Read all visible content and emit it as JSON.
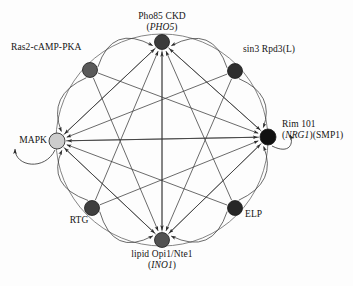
{
  "figure": {
    "type": "network-diagram",
    "background_color": "#fdfdfd",
    "ring": {
      "cx": 162,
      "cy": 140,
      "r": 106,
      "stroke": "#6f6f6f"
    },
    "nodes": [
      {
        "id": "pho85",
        "name_line1": "Pho85 CKD",
        "name_line2_open": "(",
        "name_line2_gene": "PHO5",
        "name_line2_close": ")",
        "x": 162,
        "y": 42,
        "r": 7.5,
        "fill": "#3b3b3b",
        "label_pos": "top"
      },
      {
        "id": "ras2",
        "name_line1": "Ras2-cAMP-PKA",
        "name_line2_open": "",
        "name_line2_gene": "",
        "name_line2_close": "",
        "x": 90,
        "y": 70,
        "r": 7.5,
        "fill": "#5a5a5a",
        "label_pos": "top-left"
      },
      {
        "id": "sin3",
        "name_line1": "sin3 Rpd3(L)",
        "name_line2_open": "",
        "name_line2_gene": "",
        "name_line2_close": "",
        "x": 235,
        "y": 71,
        "r": 7.5,
        "fill": "#2e2e2e",
        "label_pos": "top-right"
      },
      {
        "id": "mapk",
        "name_line1": "MAPK",
        "name_line2_open": "",
        "name_line2_gene": "",
        "name_line2_close": "",
        "x": 57,
        "y": 141,
        "r": 8,
        "fill": "#cccccc",
        "label_pos": "left"
      },
      {
        "id": "rim101",
        "name_line1": "Rim 101",
        "name_line2_open": "(",
        "name_line2_gene": "NRG1",
        "name_line2_close": ")(SMP1)",
        "x": 268,
        "y": 137,
        "r": 8,
        "fill": "#111111",
        "label_pos": "right"
      },
      {
        "id": "rtg",
        "name_line1": "RTG",
        "name_line2_open": "",
        "name_line2_gene": "",
        "name_line2_close": "",
        "x": 92,
        "y": 208,
        "r": 7.5,
        "fill": "#3f3f3f",
        "label_pos": "bottom-left"
      },
      {
        "id": "elp",
        "name_line1": "ELP",
        "name_line2_open": "",
        "name_line2_gene": "",
        "name_line2_close": "",
        "x": 235,
        "y": 208,
        "r": 7.5,
        "fill": "#262626",
        "label_pos": "bottom-right"
      },
      {
        "id": "lipid",
        "name_line1": "lipid Opi1/Nte1",
        "name_line2_open": "(",
        "name_line2_gene": "INO1",
        "name_line2_close": ")",
        "x": 162,
        "y": 240,
        "r": 7.5,
        "fill": "#525252",
        "label_pos": "bottom"
      }
    ],
    "edges": [
      {
        "from": "ras2",
        "to": "pho85"
      },
      {
        "from": "sin3",
        "to": "pho85"
      },
      {
        "from": "mapk",
        "to": "pho85"
      },
      {
        "from": "rim101",
        "to": "pho85"
      },
      {
        "from": "rtg",
        "to": "pho85"
      },
      {
        "from": "elp",
        "to": "pho85"
      },
      {
        "from": "lipid",
        "to": "pho85"
      },
      {
        "from": "pho85",
        "to": "mapk"
      },
      {
        "from": "ras2",
        "to": "mapk"
      },
      {
        "from": "sin3",
        "to": "mapk"
      },
      {
        "from": "rim101",
        "to": "mapk"
      },
      {
        "from": "rtg",
        "to": "mapk"
      },
      {
        "from": "elp",
        "to": "mapk"
      },
      {
        "from": "lipid",
        "to": "mapk"
      },
      {
        "from": "pho85",
        "to": "rim101"
      },
      {
        "from": "ras2",
        "to": "rim101"
      },
      {
        "from": "sin3",
        "to": "rim101"
      },
      {
        "from": "mapk",
        "to": "rim101"
      },
      {
        "from": "rtg",
        "to": "rim101"
      },
      {
        "from": "elp",
        "to": "rim101"
      },
      {
        "from": "lipid",
        "to": "rim101"
      },
      {
        "from": "pho85",
        "to": "lipid"
      },
      {
        "from": "ras2",
        "to": "lipid"
      },
      {
        "from": "sin3",
        "to": "lipid"
      },
      {
        "from": "mapk",
        "to": "lipid"
      },
      {
        "from": "rim101",
        "to": "lipid"
      },
      {
        "from": "rtg",
        "to": "lipid"
      },
      {
        "from": "elp",
        "to": "lipid"
      }
    ],
    "self_loops": [
      {
        "node": "mapk",
        "direction": "lower-left"
      },
      {
        "node": "rim101",
        "direction": "lower-right"
      }
    ],
    "arc_edges": [
      {
        "from": "ras2",
        "to": "pho85",
        "via": "ring"
      },
      {
        "from": "sin3",
        "to": "pho85",
        "via": "ring"
      },
      {
        "from": "ras2",
        "to": "mapk",
        "via": "ring"
      },
      {
        "from": "rtg",
        "to": "mapk",
        "via": "ring"
      },
      {
        "from": "sin3",
        "to": "rim101",
        "via": "ring"
      },
      {
        "from": "elp",
        "to": "rim101",
        "via": "ring"
      },
      {
        "from": "rtg",
        "to": "lipid",
        "via": "ring"
      },
      {
        "from": "elp",
        "to": "lipid",
        "via": "ring"
      }
    ]
  },
  "labels": {
    "pho85": {
      "line1": "Pho85 CKD",
      "gene": "PHO5"
    },
    "ras2": {
      "line1": "Ras2-cAMP-PKA"
    },
    "sin3": {
      "line1": "sin3 Rpd3(L)"
    },
    "mapk": {
      "line1": "MAPK"
    },
    "rim101": {
      "line1": "Rim 101",
      "gene": "NRG1",
      "suffix": ")(SMP1)"
    },
    "rtg": {
      "line1": "RTG"
    },
    "elp": {
      "line1": "ELP"
    },
    "lipid": {
      "line1": "lipid Opi1/Nte1",
      "gene": "INO1"
    }
  }
}
